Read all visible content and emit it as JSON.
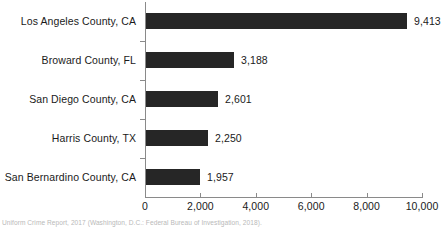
{
  "chart_data": {
    "type": "bar",
    "orientation": "horizontal",
    "title": "",
    "xlabel": "",
    "ylabel": "",
    "categories": [
      "Los Angeles County, CA",
      "Broward County, FL",
      "San Diego County, CA",
      "Harris County, TX",
      "San Bernardino County, CA"
    ],
    "values": [
      9413,
      3188,
      2601,
      2250,
      1957
    ],
    "value_labels": [
      "9,413",
      "3,188",
      "2,601",
      "2,250",
      "1,957"
    ],
    "xlim": [
      0,
      10000
    ],
    "xticks": [
      0,
      2000,
      4000,
      6000,
      8000,
      10000
    ],
    "xtick_labels": [
      "0",
      "2,000",
      "4,000",
      "6,000",
      "8,000",
      "10,000"
    ],
    "grid": false,
    "legend": null,
    "bar_color": "#262626",
    "axis_color": "#8a8a8a"
  },
  "footnote": {
    "text": "Uniform Crime Report, 2017 (Washington, D.C.: Federal Bureau of Investigation, 2018).",
    "color": "#b9b9b9"
  }
}
